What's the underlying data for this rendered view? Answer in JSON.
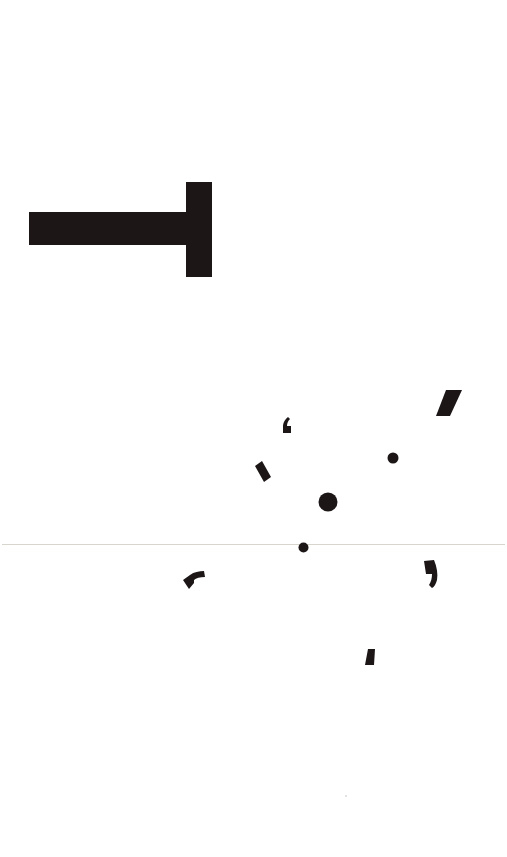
{
  "page": {
    "background": "#ffffff",
    "ink_color": "#1c1617",
    "rule_color": "#d8d6cc"
  },
  "glyph_t": {
    "description": "large T-shaped glyph rotated 90 degrees",
    "stem": {
      "x": 29,
      "y": 212,
      "w": 158,
      "h": 33
    },
    "bar": {
      "x": 186,
      "y": 182,
      "w": 26,
      "h": 95
    }
  },
  "rule": {
    "x": 2,
    "y": 544,
    "w": 503
  },
  "fragments": [
    {
      "name": "opening-quote-mark",
      "x": 283,
      "y": 417
    },
    {
      "name": "slanted-block",
      "x": 255,
      "y": 461
    },
    {
      "name": "slash-mark",
      "x": 436,
      "y": 390
    },
    {
      "name": "small-dot",
      "cx": 393,
      "cy": 458,
      "r": 5
    },
    {
      "name": "large-dot",
      "cx": 328,
      "cy": 502,
      "r": 9
    },
    {
      "name": "dot-on-rule",
      "cx": 303,
      "cy": 547,
      "r": 5
    },
    {
      "name": "curved-fragment",
      "x": 183,
      "y": 570
    },
    {
      "name": "closing-quote-mark",
      "x": 423,
      "y": 560
    },
    {
      "name": "small-wedge",
      "x": 365,
      "y": 649
    }
  ]
}
